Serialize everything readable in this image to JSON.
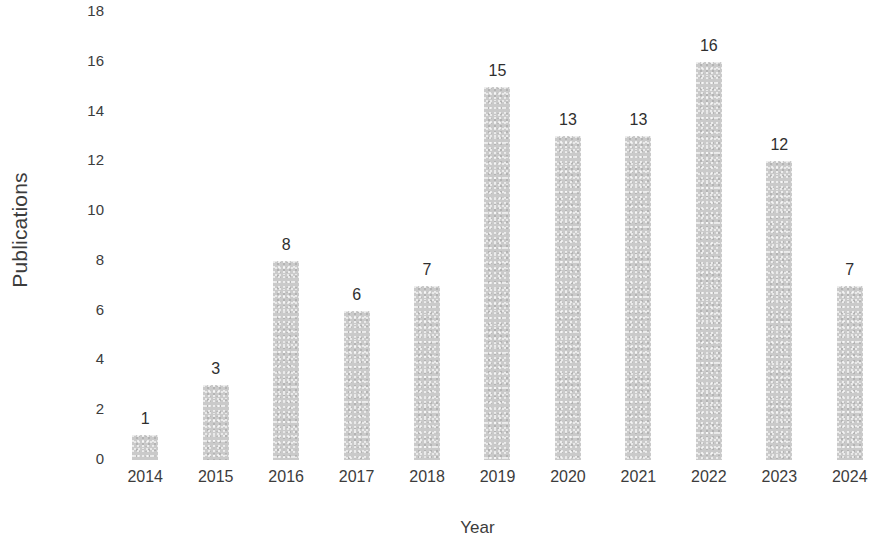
{
  "chart_data": {
    "type": "bar",
    "title": "",
    "subtitle": "",
    "xlabel": "Year",
    "ylabel": "Publications",
    "categories": [
      "2014",
      "2015",
      "2016",
      "2017",
      "2018",
      "2019",
      "2020",
      "2021",
      "2022",
      "2023",
      "2024"
    ],
    "values": [
      1,
      3,
      8,
      6,
      7,
      15,
      13,
      13,
      16,
      12,
      7
    ],
    "data_labels": [
      "1",
      "3",
      "8",
      "6",
      "7",
      "15",
      "13",
      "13",
      "16",
      "12",
      "7"
    ],
    "ylim": [
      0,
      18
    ],
    "ytick_labels": [
      "0",
      "2",
      "4",
      "6",
      "8",
      "10",
      "12",
      "14",
      "16",
      "18"
    ],
    "ytick_values": [
      0,
      2,
      4,
      6,
      8,
      10,
      12,
      14,
      16,
      18
    ],
    "grid": false,
    "legend": false,
    "legend_position": "none",
    "bar_color": "#cacaca",
    "label_color": "#2f2f2f",
    "axis_text_color": "#3c3c3c",
    "background_color": "#ffffff"
  }
}
